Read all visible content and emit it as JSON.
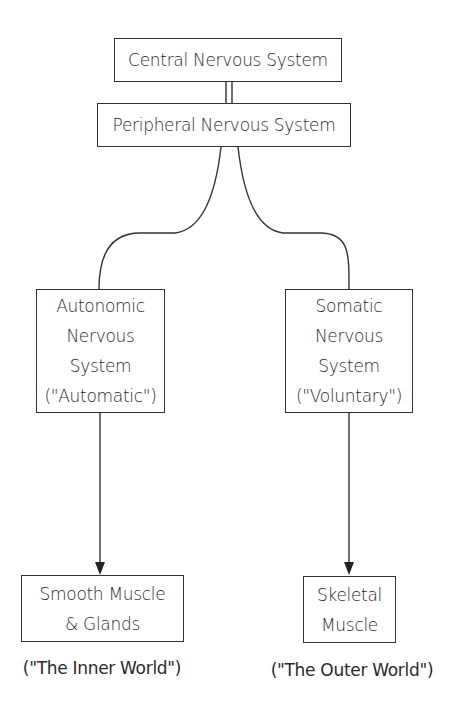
{
  "diagram": {
    "type": "hierarchy",
    "nodes": {
      "cns": {
        "label": "Central Nervous System"
      },
      "pns": {
        "label": "Peripheral Nervous System"
      },
      "ans": {
        "lines": [
          "Autonomic",
          "Nervous",
          "System",
          "(\"Automatic\")"
        ]
      },
      "sns": {
        "lines": [
          "Somatic",
          "Nervous",
          "System",
          "(\"Voluntary\")"
        ]
      },
      "smooth": {
        "lines": [
          "Smooth Muscle",
          "& Glands"
        ]
      },
      "skeletal": {
        "lines": [
          "Skeletal",
          "Muscle"
        ]
      }
    },
    "captions": {
      "inner": "(\"The Inner World\")",
      "outer": "(\"The Outer World\")"
    },
    "edges": [
      {
        "from": "cns",
        "to": "pns",
        "style": "double-line"
      },
      {
        "from": "pns",
        "to": "ans",
        "style": "curve"
      },
      {
        "from": "pns",
        "to": "sns",
        "style": "curve"
      },
      {
        "from": "ans",
        "to": "smooth",
        "style": "arrow"
      },
      {
        "from": "sns",
        "to": "skeletal",
        "style": "arrow"
      }
    ],
    "colors": {
      "stroke": "#333333",
      "background": "#ffffff",
      "text": "#2a2a2a"
    }
  }
}
